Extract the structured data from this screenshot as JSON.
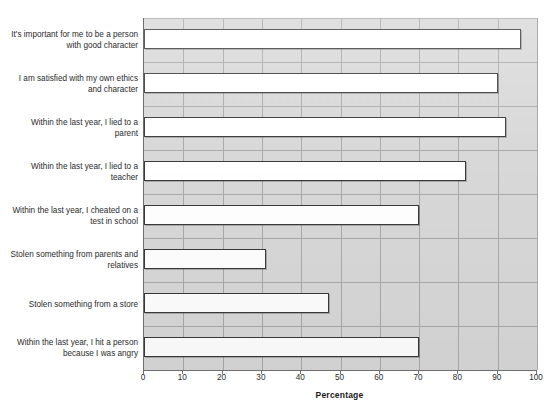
{
  "chart_data": {
    "type": "bar",
    "orientation": "horizontal",
    "title": "",
    "xlabel": "Percentage",
    "ylabel": "",
    "xlim": [
      0,
      100
    ],
    "xticks": [
      "0",
      "10",
      "20",
      "30",
      "40",
      "50",
      "60",
      "70",
      "80",
      "90",
      "100"
    ],
    "grid": "vertical-and-horizontal",
    "legend": "none",
    "categories": [
      "It's important for me to be a person with good character",
      "I am satisfied with my own ethics and character",
      "Within the last year, I lied to a parent",
      "Within the last year, I lied to a teacher",
      "Within the last year, I cheated on a test in school",
      "Stolen something from parents and relatives",
      "Stolen something from a store",
      "Within the last year, I hit a person because I was angry"
    ],
    "category_lines": [
      [
        "It's important for me to be a person",
        "with good character"
      ],
      [
        "I am satisfied with my own ethics",
        "and character"
      ],
      [
        "Within the last year, I lied to a",
        "parent"
      ],
      [
        "Within the last year, I lied to a",
        "teacher"
      ],
      [
        "Within the last year, I cheated on a",
        "test in school"
      ],
      [
        "Stolen something from parents and",
        "relatives"
      ],
      [
        "Stolen something from a store",
        ""
      ],
      [
        "Within the last year, I hit a person",
        "because I was angry"
      ]
    ],
    "values": [
      96,
      90,
      92,
      82,
      70,
      31,
      47,
      70
    ],
    "colors": {
      "bar_fill": "#ffffff",
      "bar_edge": "#3a3a3a",
      "plot_background": "#d8d8d8",
      "gridline": "#a9a9a9",
      "axis": "#6e6e6e",
      "text": "#2b2b2b"
    }
  },
  "axis": {
    "x_label": "Percentage"
  },
  "header": {
    "cropped_title": ""
  }
}
